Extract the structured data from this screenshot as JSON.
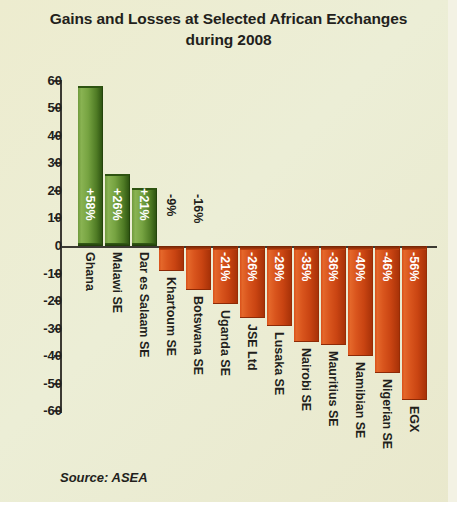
{
  "chart": {
    "title_line1": "Gains and Losses at Selected African Exchanges",
    "title_line2": "during 2008",
    "source": "Source: ASEA"
  },
  "chart_data": {
    "type": "bar",
    "title": "Gains and Losses at Selected African Exchanges during 2008",
    "xlabel": "",
    "ylabel": "",
    "ylim": [
      -60,
      60
    ],
    "yticks": [
      60,
      50,
      40,
      30,
      20,
      10,
      0,
      -10,
      -20,
      -30,
      -40,
      -50,
      -60
    ],
    "ytick_labels": [
      "60",
      "50",
      "40",
      "30",
      "20",
      "10",
      "0",
      "-10",
      "-20",
      "-30",
      "-40",
      "-50",
      "-60"
    ],
    "grid": false,
    "legend": "none",
    "categories": [
      "Ghana",
      "Malawi SE",
      "Dar es Salaam SE",
      "Khartoum SE",
      "Botswana SE",
      "Uganda SE",
      "JSE Ltd",
      "Lusaka SE",
      "Nairobi SE",
      "Mauritius SE",
      "Namibian SE",
      "Nigerian SE",
      "EGX"
    ],
    "values": [
      58,
      26,
      21,
      -9,
      -16,
      -21,
      -26,
      -29,
      -35,
      -36,
      -40,
      -46,
      -56
    ],
    "data_labels": [
      "+58%",
      "+26%",
      "+21%",
      "-9%",
      "-16%",
      "-21%",
      "-26%",
      "-29%",
      "-35%",
      "-36%",
      "-40%",
      "-46%",
      "-56%"
    ],
    "colors": {
      "positive": "#5f8f2e",
      "negative": "#d2500f",
      "background": "#ecebd2",
      "axis": "#3c3a33",
      "text": "#231f1c"
    }
  }
}
